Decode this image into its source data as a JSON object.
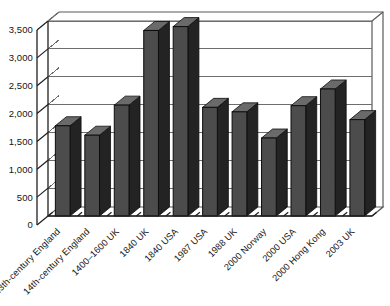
{
  "chart_data": {
    "type": "bar",
    "title": "",
    "subtitle": "",
    "xlabel": "",
    "ylabel": "",
    "categories": [
      "13th-century England",
      "14th-century England",
      "1400–1600 UK",
      "1840 UK",
      "1840 USA",
      "1987 USA",
      "1988 UK",
      "2000 Norway",
      "2000 USA",
      "2000 Hong Kong",
      "2003 UK"
    ],
    "values": [
      1620,
      1450,
      1990,
      3330,
      3400,
      1950,
      1870,
      1400,
      1980,
      2280,
      1730
    ],
    "ylim": [
      0,
      3500
    ],
    "ytick_values": [
      0,
      500,
      1000,
      1500,
      2000,
      2500,
      3000,
      3500
    ],
    "ytick_labels": [
      "0",
      "500",
      "1,000",
      "1,500",
      "2,000",
      "2,500",
      "3,000",
      "3,500"
    ],
    "grid": true,
    "grid_axis": "y",
    "legend": false,
    "legend_position": "none",
    "bar_color": "#4c4c4c",
    "bar_edge_color": "#0d0d0d",
    "bar_side_color": "#232323",
    "bar_top_color": "#6a6a6a",
    "gridline_color": "#6d6d6d",
    "axis_color": "#1f1f1f",
    "background_color": "#ffffff",
    "style": "3d-bar",
    "label_rotation_deg": -45
  },
  "figure": {
    "plot_left": 48,
    "plot_right": 372,
    "plot_top": 21,
    "plot_bottom": 216,
    "depth_x": 11,
    "depth_y": 9
  }
}
